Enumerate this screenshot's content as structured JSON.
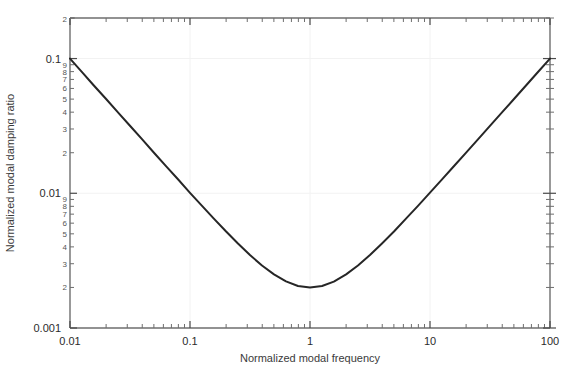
{
  "chart_data": {
    "type": "line",
    "title": "",
    "xlabel": "Normalized modal frequency",
    "ylabel": "Normalized modal damping ratio",
    "xscale": "log",
    "yscale": "log",
    "xlim": [
      0.01,
      100
    ],
    "ylim": [
      0.001,
      0.2
    ],
    "grid": true,
    "legend": null,
    "x_major_ticks": [
      0.01,
      0.1,
      1,
      10,
      100
    ],
    "x_major_tick_labels": [
      "0.01",
      "0.1",
      "1",
      "10",
      "100"
    ],
    "y_major_ticks": [
      0.001,
      0.01,
      0.1,
      0.2
    ],
    "y_major_tick_labels": [
      "0.001",
      "0.01",
      "0.1",
      "2"
    ],
    "y_minor_tick_labels_decade": [
      "2",
      "3",
      "4",
      "5",
      "6",
      "7",
      "8",
      "9"
    ],
    "line_color": "#262626",
    "line_width": 2,
    "grid_color": "#f2f2f2",
    "axis_color": "#6e6e6e",
    "series": [
      {
        "name": "Rayleigh damping",
        "formula": "y = 0.001 * (1/x + x)",
        "x": [
          0.01,
          0.0126,
          0.0158,
          0.02,
          0.0251,
          0.0316,
          0.0398,
          0.0501,
          0.0631,
          0.0794,
          0.1,
          0.126,
          0.158,
          0.2,
          0.251,
          0.316,
          0.398,
          0.501,
          0.631,
          0.794,
          1.0,
          1.26,
          1.58,
          2.0,
          2.51,
          3.16,
          3.98,
          5.01,
          6.31,
          7.94,
          10.0,
          12.6,
          15.8,
          20.0,
          25.1,
          31.6,
          39.8,
          50.1,
          63.1,
          79.4,
          100.0
        ],
        "y": [
          0.1,
          0.0794,
          0.0631,
          0.0501,
          0.0399,
          0.0317,
          0.0252,
          0.02,
          0.0159,
          0.0127,
          0.01008,
          0.00806,
          0.00649,
          0.0052,
          0.00424,
          0.00348,
          0.00291,
          0.0025,
          0.00222,
          0.00205,
          0.002,
          0.00205,
          0.00221,
          0.0025,
          0.00291,
          0.00348,
          0.00424,
          0.0052,
          0.00649,
          0.00806,
          0.0101,
          0.01268,
          0.01586,
          0.02005,
          0.02514,
          0.03163,
          0.03983,
          0.05012,
          0.06311,
          0.07941,
          0.10001
        ]
      }
    ],
    "minimum_point": {
      "x": 1,
      "y": 0.002
    },
    "endpoints": [
      {
        "x": 0.01,
        "y": 0.1
      },
      {
        "x": 100,
        "y": 0.1
      }
    ]
  }
}
